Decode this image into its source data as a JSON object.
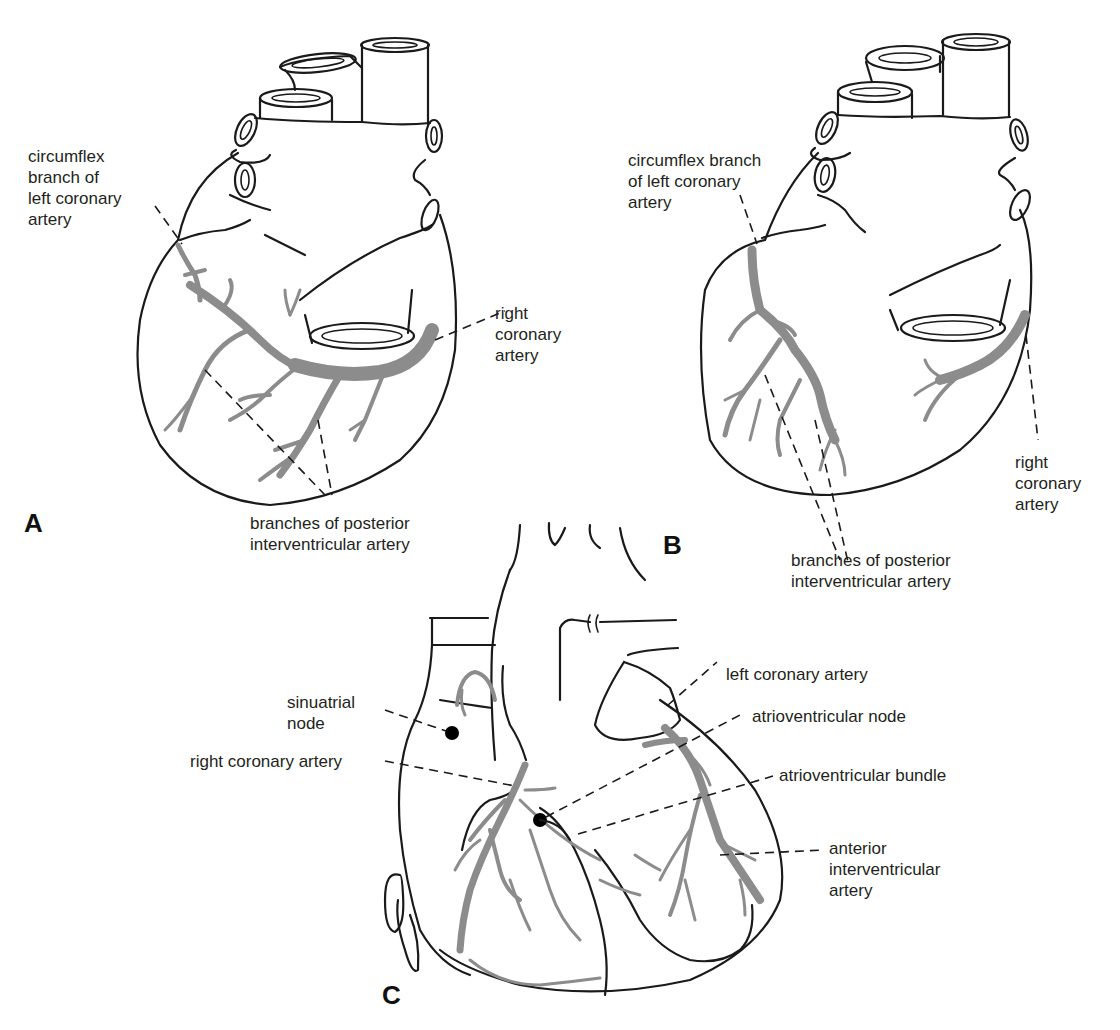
{
  "figure": {
    "panels": [
      {
        "id": "A",
        "letter": "A",
        "view": "posterior view of heart",
        "labels": {
          "circumflex": "circumflex\nbranch of\nleft coronary\nartery",
          "right_coronary": "right\ncoronary\nartery",
          "posterior_branches": "branches of posterior\ninterventricular artery"
        }
      },
      {
        "id": "B",
        "letter": "B",
        "view": "posterior view of heart (variant)",
        "labels": {
          "circumflex": "circumflex branch\nof left coronary\nartery",
          "right_coronary": "right\ncoronary\nartery",
          "posterior_branches": "branches of posterior\ninterventricular artery"
        }
      },
      {
        "id": "C",
        "letter": "C",
        "view": "anterior view of heart with conduction system",
        "labels": {
          "sa_node": "sinuatrial\nnode",
          "right_coronary": "right coronary artery",
          "left_coronary": "left coronary artery",
          "av_node": "atrioventricular node",
          "av_bundle": "atrioventricular bundle",
          "anterior_iv": "anterior\ninterventricular\nartery"
        }
      }
    ],
    "colors": {
      "outline": "#1a1a1a",
      "artery": "#8c8c8c",
      "node": "#000000",
      "background": "#ffffff"
    }
  }
}
